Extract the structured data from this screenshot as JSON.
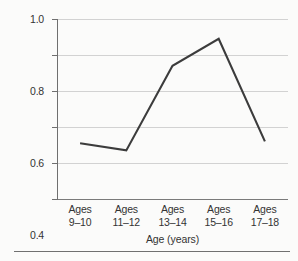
{
  "chart_data": {
    "type": "line",
    "title": "",
    "subtitle": "",
    "xlabel": "Age (years)",
    "ylabel": "Conflicts per minute",
    "categories": [
      "Ages\n9–10",
      "Ages\n11–12",
      "Ages\n13–14",
      "Ages\n15–16",
      "Ages\n17–18"
    ],
    "category_lines": [
      {
        "line1": "Ages",
        "line2": "9–10"
      },
      {
        "line1": "Ages",
        "line2": "11–12"
      },
      {
        "line1": "Ages",
        "line2": "13–14"
      },
      {
        "line1": "Ages",
        "line2": "15–16"
      },
      {
        "line1": "Ages",
        "line2": "17–18"
      }
    ],
    "values": [
      0.31,
      0.27,
      0.74,
      0.89,
      0.32
    ],
    "ylim": [
      0.0,
      1.0
    ],
    "yticks": [
      0.0,
      0.2,
      0.4,
      0.6,
      0.8,
      1.0
    ],
    "ytick_labels": [
      "0.0",
      "0.2",
      "0.4",
      "0.6",
      "0.8",
      "1.0"
    ],
    "grid": "horizontal",
    "legend": "none",
    "line_color": "#3c3c3c",
    "grid_color": "#d2d2d2",
    "axis_color": "#6f6f6f",
    "background_color": "#fbfbfa",
    "series": [
      {
        "name": "Conflicts per minute",
        "values": [
          0.31,
          0.27,
          0.74,
          0.89,
          0.32
        ]
      }
    ]
  }
}
